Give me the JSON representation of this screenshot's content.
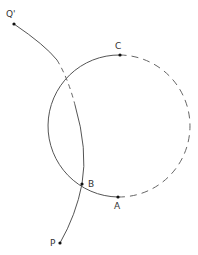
{
  "diagram": {
    "labels": {
      "q_prime": "Q'",
      "c": "C",
      "b": "B",
      "a": "A",
      "p": "P"
    },
    "colors": {
      "stroke": "#555555",
      "point": "#111111",
      "background": "#ffffff"
    },
    "circle": {
      "cx": 120,
      "cy": 126,
      "r": 71
    },
    "points": {
      "q_prime": [
        14,
        24
      ],
      "c": [
        120,
        55
      ],
      "b": [
        82,
        184
      ],
      "a": [
        118,
        197
      ],
      "p": [
        60,
        243
      ]
    }
  }
}
